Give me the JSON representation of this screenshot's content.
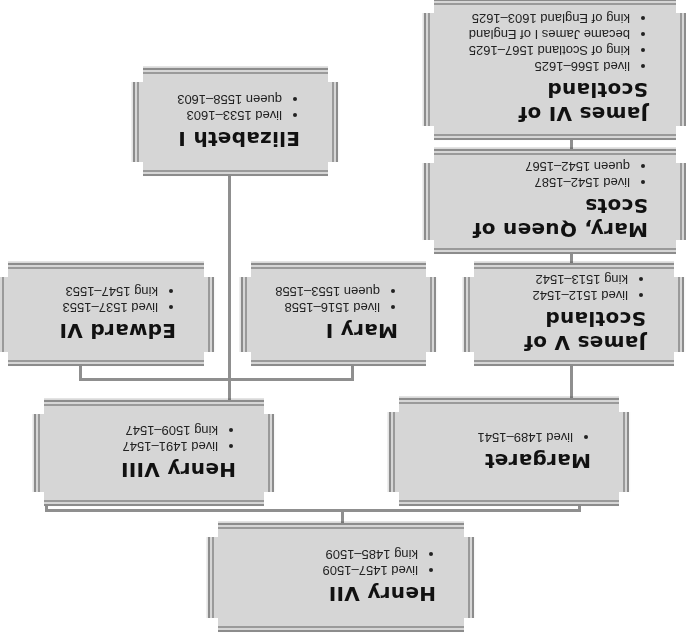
{
  "colors": {
    "box_fill": "#d6d6d6",
    "border": "#8c8c8c",
    "connector": "#8f8f8f",
    "text": "#111111"
  },
  "orientation": "rotated 180 degrees",
  "people": {
    "henry_vii": {
      "name": "Henry VII",
      "facts": [
        "lived 1457–1509",
        "king 1485–1509"
      ]
    },
    "henry_viii": {
      "name": "Henry VIII",
      "facts": [
        "lived 1491–1547",
        "king 1509–1547"
      ]
    },
    "margaret": {
      "name": "Margaret",
      "facts": [
        "lived 1489–1541"
      ]
    },
    "edward_vi": {
      "name": "Edward VI",
      "facts": [
        "lived 1537–1553",
        "king 1547–1553"
      ]
    },
    "mary_i": {
      "name": "Mary I",
      "facts": [
        "lived 1516–1558",
        "queen 1553–1558"
      ]
    },
    "elizabeth_i": {
      "name": "Elizabeth I",
      "facts": [
        "lived 1533–1603",
        "queen 1558–1603"
      ]
    },
    "james_v": {
      "name": "James V of Scotland",
      "facts": [
        "lived 1512–1542",
        "king 1513–1542"
      ]
    },
    "mary_qos": {
      "name": "Mary, Queen of Scots",
      "facts": [
        "lived 1542–1587",
        "queen 1542–1567"
      ]
    },
    "james_vi": {
      "name": "James VI of Scotland",
      "facts": [
        "lived 1566–1625",
        "king of Scotland 1567–1625",
        "became James I of England",
        "king of England 1603–1625"
      ]
    }
  },
  "relations": [
    {
      "parent": "Henry VII",
      "children": [
        "Henry VIII",
        "Margaret"
      ]
    },
    {
      "parent": "Henry VIII",
      "children": [
        "Edward VI",
        "Mary I",
        "Elizabeth I"
      ]
    },
    {
      "parent": "Margaret",
      "children": [
        "James V of Scotland"
      ]
    },
    {
      "parent": "James V of Scotland",
      "children": [
        "Mary, Queen of Scots"
      ]
    },
    {
      "parent": "Mary, Queen of Scots",
      "children": [
        "James VI of Scotland"
      ]
    }
  ]
}
